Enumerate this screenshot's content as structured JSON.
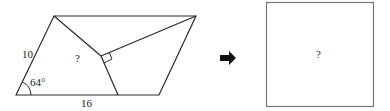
{
  "figure": {
    "left_shape": {
      "type": "parallelogram",
      "side_label": "10",
      "base_label": "16",
      "angle_label": "64°",
      "region_label": "?"
    },
    "arrow": {
      "icon": "right-arrow-icon"
    },
    "right_shape": {
      "type": "square",
      "region_label": "?"
    },
    "colors": {
      "stroke": "#2a2a2a",
      "arrow": "#111111",
      "square_stroke": "#777777"
    }
  }
}
